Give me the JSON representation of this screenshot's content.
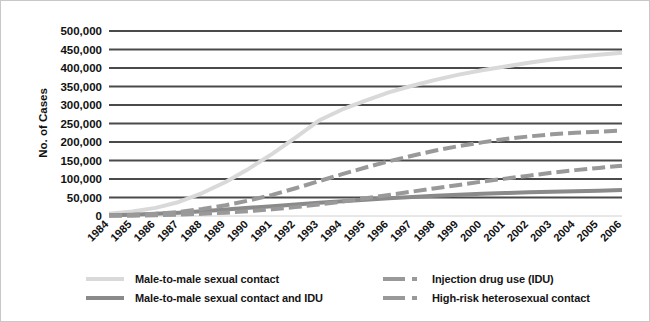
{
  "chart_data": {
    "type": "line",
    "title": "",
    "xlabel": "",
    "ylabel": "No. of Cases",
    "ylim": [
      0,
      500000
    ],
    "ytick_labels": [
      "500,000",
      "450,000",
      "400,000",
      "350,000",
      "300,000",
      "250,000",
      "200,000",
      "150,000",
      "100,000",
      "50,000",
      "0"
    ],
    "ytick_values": [
      500000,
      450000,
      400000,
      350000,
      300000,
      250000,
      200000,
      150000,
      100000,
      50000,
      0
    ],
    "grid": true,
    "legend_position": "bottom",
    "categories": [
      "1984",
      "1985",
      "1986",
      "1987",
      "1988",
      "1989",
      "1990",
      "1991",
      "1992",
      "1993",
      "1994",
      "1995",
      "1996",
      "1997",
      "1998",
      "1999",
      "2000",
      "2001",
      "2002",
      "2003",
      "2004",
      "2005",
      "2006"
    ],
    "series": [
      {
        "name": "Male-to-male sexual contact",
        "color": "#d9d9d9",
        "style": "solid",
        "values": [
          6000,
          12000,
          22000,
          38000,
          62000,
          92000,
          128000,
          168000,
          212000,
          258000,
          288000,
          312000,
          334000,
          352000,
          368000,
          382000,
          394000,
          404000,
          414000,
          423000,
          430000,
          436000,
          441000
        ]
      },
      {
        "name": "Male-to-male sexual contact and IDU",
        "color": "#8a8a8a",
        "style": "solid",
        "values": [
          2000,
          3500,
          6000,
          9000,
          13000,
          17500,
          22000,
          26500,
          31000,
          36000,
          40000,
          44000,
          48000,
          51500,
          55000,
          57500,
          60000,
          62000,
          64000,
          65500,
          67000,
          68500,
          70000
        ]
      },
      {
        "name": "Injection drug use (IDU)",
        "color": "#999999",
        "style": "dashed",
        "values": [
          1500,
          3000,
          6000,
          11000,
          19000,
          29000,
          42000,
          57000,
          75000,
          94000,
          113000,
          131000,
          148000,
          163000,
          177000,
          189000,
          199000,
          208000,
          215000,
          221000,
          225000,
          228000,
          231000
        ]
      },
      {
        "name": "High-risk heterosexual contact",
        "color": "#999999",
        "style": "dashed",
        "values": [
          500,
          1000,
          2000,
          3500,
          6000,
          9000,
          13000,
          18000,
          24000,
          31000,
          39000,
          48000,
          57000,
          66000,
          75000,
          84000,
          93000,
          101000,
          109000,
          117000,
          124000,
          130000,
          136000
        ]
      }
    ]
  },
  "legend": {
    "left": [
      {
        "label": "Male-to-male sexual contact",
        "color": "#d9d9d9",
        "style": "solid"
      },
      {
        "label": "Male-to-male sexual contact and IDU",
        "color": "#8a8a8a",
        "style": "solid"
      }
    ],
    "right": [
      {
        "label": "Injection drug use (IDU)",
        "color": "#999999",
        "style": "dashed"
      },
      {
        "label": "High-risk heterosexual contact",
        "color": "#999999",
        "style": "dashed"
      }
    ]
  },
  "colors": {
    "gridline": "#4a4a4a",
    "baseline": "#d0d0d0",
    "text": "#111111",
    "border": "#c8c8c8"
  }
}
